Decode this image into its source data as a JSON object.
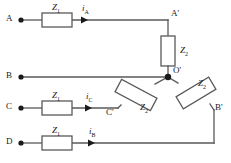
{
  "diagram": {
    "stroke_color": "#58595b",
    "text_color": "#1a1a1a",
    "box_fill": "#ffffff",
    "terminals": [
      {
        "id": "A",
        "label": "A"
      },
      {
        "id": "B",
        "label": "B"
      },
      {
        "id": "C",
        "label": "C"
      },
      {
        "id": "D",
        "label": "D"
      }
    ],
    "nodes": [
      {
        "id": "Ap",
        "label": "A'"
      },
      {
        "id": "Op",
        "label": "O'"
      },
      {
        "id": "Bp",
        "label": "B'"
      },
      {
        "id": "Cp",
        "label": "C'"
      }
    ],
    "impedances": [
      {
        "id": "z1-a",
        "symbol": "Z",
        "subscript": "1",
        "orientation": "horizontal",
        "branch": "A"
      },
      {
        "id": "z1-c",
        "symbol": "Z",
        "subscript": "1",
        "orientation": "horizontal",
        "branch": "C"
      },
      {
        "id": "z1-d",
        "symbol": "Z",
        "subscript": "1",
        "orientation": "horizontal",
        "branch": "D"
      },
      {
        "id": "z2-ap",
        "symbol": "Z",
        "subscript": "2",
        "orientation": "vertical",
        "branch": "A'-O'"
      },
      {
        "id": "z2-bp",
        "symbol": "Z",
        "subscript": "2",
        "orientation": "diagonal-down-right",
        "branch": "O'-B'"
      },
      {
        "id": "z2-cp",
        "symbol": "Z",
        "subscript": "2",
        "orientation": "diagonal-down-left",
        "branch": "O'-C'"
      }
    ],
    "currents": [
      {
        "id": "i-a",
        "symbol": "i",
        "subscript": "A",
        "branch": "A",
        "direction": "right"
      },
      {
        "id": "i-c",
        "symbol": "i",
        "subscript": "C",
        "branch": "C",
        "direction": "right"
      },
      {
        "id": "i-b",
        "symbol": "i",
        "subscript": "B",
        "branch": "D",
        "direction": "right"
      }
    ]
  }
}
